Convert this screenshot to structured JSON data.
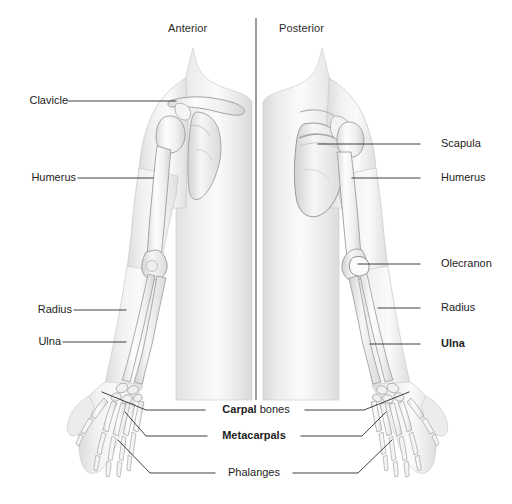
{
  "diagram": {
    "title_absent": true,
    "background_color": "#ffffff",
    "line_color": "#2b2b2b",
    "text_color": "#1d1d1d",
    "bone_fill": "#f2f2f2",
    "body_fill": "#e8e8e8",
    "headings": [
      {
        "id": "anterior",
        "label": "Anterior"
      },
      {
        "id": "posterior",
        "label": "Posterior"
      }
    ],
    "divider": {
      "x": 256,
      "y1": 18,
      "y2": 400
    },
    "labels_left": [
      {
        "id": "clavicle",
        "label": "Clavicle",
        "bold": false,
        "text_x": 65,
        "text_y": 95,
        "line_x1": 68,
        "line_x2": 175,
        "line_y": 101,
        "target_x": 175,
        "target_y": 101
      },
      {
        "id": "humerus-anterior",
        "label": "Humerus",
        "bold": false,
        "text_x": 27,
        "text_y": 172,
        "line_x1": 78,
        "line_x2": 152,
        "line_y": 178,
        "target_x": 152,
        "target_y": 178
      },
      {
        "id": "radius-anterior",
        "label": "Radius",
        "bold": false,
        "text_x": 30,
        "text_y": 304,
        "line_x1": 74,
        "line_x2": 124,
        "line_y": 310,
        "target_x": 124,
        "target_y": 310
      },
      {
        "id": "ulna-anterior",
        "label": "Ulna",
        "bold": false,
        "text_x": 33,
        "text_y": 336,
        "line_x1": 63,
        "line_x2": 124,
        "line_y": 342,
        "target_x": 124,
        "target_y": 342
      }
    ],
    "labels_right": [
      {
        "id": "scapula",
        "label": "Scapula",
        "bold": false,
        "text_x": 441,
        "text_y": 138,
        "line_x1": 420,
        "line_x2": 318,
        "line_y": 144,
        "target_x": 318,
        "target_y": 152
      },
      {
        "id": "humerus-posterior",
        "label": "Humerus",
        "bold": false,
        "text_x": 441,
        "text_y": 172,
        "line_x1": 420,
        "line_x2": 352,
        "line_y": 178,
        "target_x": 352,
        "target_y": 178
      },
      {
        "id": "olecranon",
        "label": "Olecranon",
        "bold": false,
        "text_x": 441,
        "text_y": 258,
        "line_x1": 420,
        "line_x2": 357,
        "line_y": 264,
        "target_x": 357,
        "target_y": 264
      },
      {
        "id": "radius-posterior",
        "label": "Radius",
        "bold": false,
        "text_x": 441,
        "text_y": 302,
        "line_x1": 420,
        "line_x2": 378,
        "line_y": 308,
        "target_x": 378,
        "target_y": 308
      },
      {
        "id": "ulna-posterior",
        "label": "Ulna",
        "bold": true,
        "text_x": 441,
        "text_y": 338,
        "line_x1": 420,
        "line_x2": 370,
        "line_y": 344,
        "target_x": 370,
        "target_y": 344
      }
    ],
    "labels_center": [
      {
        "id": "carpal-bones",
        "label_bold": "Carpal",
        "label_regular": " bones",
        "text_x": 212,
        "text_y": 404,
        "left_line": {
          "x1": 205,
          "y1": 410,
          "x2": 143,
          "y2": 410,
          "x3": 100,
          "y3": 392
        },
        "right_line": {
          "x1": 303,
          "y1": 410,
          "x2": 367,
          "y2": 410,
          "x3": 412,
          "y3": 390
        }
      },
      {
        "id": "metacarpals",
        "label_bold": "Metacarpals",
        "label_regular": "",
        "text_x": 216,
        "text_y": 430,
        "left_line": {
          "x1": 208,
          "y1": 436,
          "x2": 143,
          "y2": 436,
          "x3": 96,
          "y3": 410
        },
        "right_line": {
          "x1": 299,
          "y1": 436,
          "x2": 362,
          "y2": 436,
          "x3": 410,
          "y3": 408
        }
      },
      {
        "id": "phalanges",
        "label_bold": "",
        "label_regular": "Phalanges",
        "text_x": 225,
        "text_y": 467,
        "left_line": {
          "x1": 214,
          "y1": 473,
          "x2": 148,
          "y2": 473,
          "x3": 105,
          "y3": 436
        },
        "right_line": {
          "x1": 292,
          "y1": 473,
          "x2": 358,
          "y2": 473,
          "x3": 404,
          "y3": 434
        }
      }
    ]
  }
}
